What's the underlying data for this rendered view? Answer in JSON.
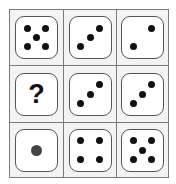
{
  "puzzle": {
    "rows": 3,
    "cols": 3,
    "colors": {
      "grid_line": "#7a7a7a",
      "cell_background": "#f3f3f3",
      "die_face": "#ffffff",
      "die_border": "#555555",
      "pip": "#111111",
      "single_pip": "#444444"
    },
    "cells": [
      {
        "row": 0,
        "col": 0,
        "type": "die",
        "value": 5
      },
      {
        "row": 0,
        "col": 1,
        "type": "die",
        "value": 3
      },
      {
        "row": 0,
        "col": 2,
        "type": "die",
        "value": 2
      },
      {
        "row": 1,
        "col": 0,
        "type": "question",
        "label": "?"
      },
      {
        "row": 1,
        "col": 1,
        "type": "die",
        "value": 3
      },
      {
        "row": 1,
        "col": 2,
        "type": "die",
        "value": 3
      },
      {
        "row": 2,
        "col": 0,
        "type": "die",
        "value": 1
      },
      {
        "row": 2,
        "col": 1,
        "type": "die",
        "value": 4
      },
      {
        "row": 2,
        "col": 2,
        "type": "die",
        "value": 5
      }
    ]
  }
}
